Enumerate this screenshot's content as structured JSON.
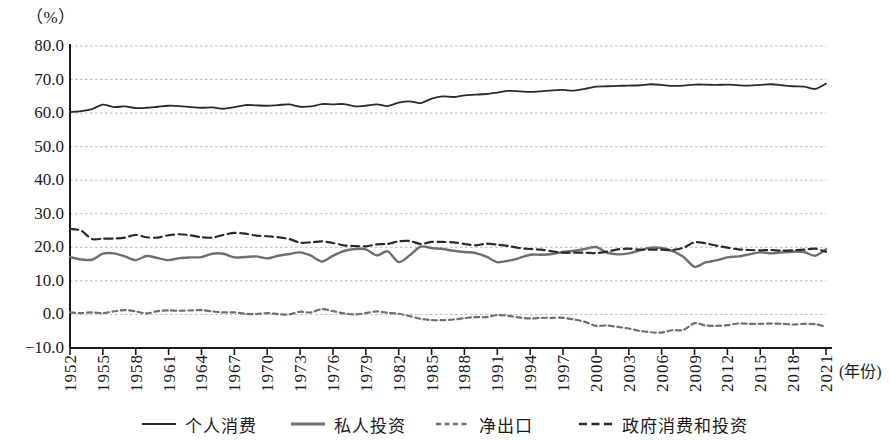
{
  "chart_data": {
    "type": "line",
    "title": "",
    "unit_label": "（%）",
    "xlabel": "(年份)",
    "ylabel": "",
    "ylim": [
      -10,
      80
    ],
    "ytick_labels": [
      "80.0",
      "70.0",
      "60.0",
      "50.0",
      "40.0",
      "30.0",
      "20.0",
      "10.0",
      "0.0",
      "−10.0"
    ],
    "ytick_values": [
      80,
      70,
      60,
      50,
      40,
      30,
      20,
      10,
      0,
      -10
    ],
    "grid": true,
    "grid_style": "dotted-horizontal",
    "legend_position": "bottom",
    "xlim": [
      1952,
      2021
    ],
    "xtick_labels": [
      "1952",
      "1955",
      "1958",
      "1961",
      "1964",
      "1967",
      "1970",
      "1973",
      "1976",
      "1979",
      "1982",
      "1985",
      "1988",
      "1991",
      "1994",
      "1997",
      "2000",
      "2003",
      "2006",
      "2009",
      "2012",
      "2015",
      "2018",
      "2021"
    ],
    "x": [
      1952,
      1953,
      1954,
      1955,
      1956,
      1957,
      1958,
      1959,
      1960,
      1961,
      1962,
      1963,
      1964,
      1965,
      1966,
      1967,
      1968,
      1969,
      1970,
      1971,
      1972,
      1973,
      1974,
      1975,
      1976,
      1977,
      1978,
      1979,
      1980,
      1981,
      1982,
      1983,
      1984,
      1985,
      1986,
      1987,
      1988,
      1989,
      1990,
      1991,
      1992,
      1993,
      1994,
      1995,
      1996,
      1997,
      1998,
      1999,
      2000,
      2001,
      2002,
      2003,
      2004,
      2005,
      2006,
      2007,
      2008,
      2009,
      2010,
      2011,
      2012,
      2013,
      2014,
      2015,
      2016,
      2017,
      2018,
      2019,
      2020,
      2021
    ],
    "series": [
      {
        "name": "个人消费",
        "style": "solid",
        "color": "#2b2b2b",
        "width": 1.8,
        "values": [
          60.3,
          60.6,
          61.2,
          62.5,
          61.8,
          62.0,
          61.5,
          61.6,
          61.9,
          62.2,
          62.1,
          61.8,
          61.6,
          61.7,
          61.3,
          61.8,
          62.4,
          62.3,
          62.2,
          62.4,
          62.6,
          61.9,
          62.0,
          62.7,
          62.6,
          62.7,
          62.0,
          62.2,
          62.6,
          62.1,
          63.1,
          63.5,
          63.0,
          64.3,
          65.0,
          64.8,
          65.3,
          65.5,
          65.7,
          66.1,
          66.6,
          66.5,
          66.3,
          66.5,
          66.8,
          66.9,
          66.7,
          67.2,
          67.9,
          68.0,
          68.1,
          68.2,
          68.3,
          68.6,
          68.4,
          68.1,
          68.2,
          68.5,
          68.5,
          68.4,
          68.5,
          68.3,
          68.2,
          68.4,
          68.6,
          68.3,
          68.0,
          67.9,
          67.2,
          68.8
        ]
      },
      {
        "name": "私人投资",
        "style": "solid",
        "color": "#6f6f6f",
        "width": 2.4,
        "values": [
          17.1,
          16.4,
          16.3,
          18.1,
          18.2,
          17.3,
          16.2,
          17.4,
          16.8,
          16.2,
          16.8,
          17.0,
          17.1,
          18.1,
          18.1,
          17.0,
          17.1,
          17.3,
          16.7,
          17.5,
          18.0,
          18.5,
          17.5,
          15.8,
          17.5,
          18.9,
          19.5,
          19.4,
          17.6,
          18.8,
          15.6,
          17.6,
          20.2,
          19.8,
          19.5,
          19.0,
          18.6,
          18.3,
          17.2,
          15.6,
          16.0,
          16.8,
          17.8,
          17.8,
          18.0,
          18.6,
          19.0,
          19.5,
          20.1,
          18.4,
          17.9,
          18.2,
          19.1,
          19.9,
          19.8,
          18.9,
          17.1,
          14.2,
          15.5,
          16.1,
          17.0,
          17.3,
          17.9,
          18.5,
          18.2,
          18.5,
          18.7,
          18.6,
          17.5,
          19.4
        ]
      },
      {
        "name": "净出口",
        "style": "dashed-short",
        "color": "#6f6f6f",
        "width": 2.2,
        "values": [
          0.6,
          0.4,
          0.6,
          0.4,
          0.9,
          1.3,
          0.9,
          0.3,
          1.0,
          1.2,
          1.1,
          1.2,
          1.3,
          0.9,
          0.6,
          0.6,
          0.2,
          0.1,
          0.4,
          0.1,
          0.0,
          0.8,
          0.6,
          1.6,
          1.0,
          0.3,
          0.0,
          0.4,
          0.9,
          0.5,
          0.2,
          -0.5,
          -1.3,
          -1.7,
          -1.7,
          -1.5,
          -1.1,
          -0.8,
          -0.8,
          -0.2,
          -0.4,
          -0.9,
          -1.2,
          -1.0,
          -1.0,
          -1.0,
          -1.5,
          -2.2,
          -3.4,
          -3.3,
          -3.7,
          -4.2,
          -4.9,
          -5.3,
          -5.4,
          -4.7,
          -4.6,
          -2.6,
          -3.3,
          -3.4,
          -3.2,
          -2.7,
          -2.8,
          -2.8,
          -2.7,
          -2.8,
          -3.0,
          -2.8,
          -2.9,
          -3.7
        ]
      },
      {
        "name": "政府消费和投资",
        "style": "dashed-long",
        "color": "#2b2b2b",
        "width": 2.2,
        "values": [
          25.5,
          25.0,
          22.5,
          22.6,
          22.6,
          22.9,
          23.7,
          23.0,
          22.9,
          23.6,
          23.9,
          23.6,
          23.0,
          22.9,
          23.7,
          24.3,
          24.1,
          23.5,
          23.3,
          23.0,
          22.5,
          21.4,
          21.5,
          21.8,
          21.3,
          20.6,
          20.4,
          20.3,
          20.9,
          21.0,
          21.8,
          21.9,
          21.0,
          21.6,
          21.6,
          21.5,
          21.0,
          20.6,
          21.1,
          20.8,
          20.4,
          19.8,
          19.5,
          19.3,
          18.8,
          18.4,
          18.4,
          18.4,
          18.3,
          18.7,
          19.4,
          19.6,
          19.3,
          19.3,
          19.3,
          19.2,
          19.9,
          21.5,
          21.2,
          20.5,
          19.9,
          19.4,
          19.2,
          19.1,
          19.2,
          19.0,
          19.1,
          19.3,
          19.6,
          18.7
        ]
      }
    ]
  },
  "legend": {
    "items": [
      {
        "label": "个人消费",
        "swatch": "solid-dark"
      },
      {
        "label": "私人投资",
        "swatch": "solid-gray-thick"
      },
      {
        "label": "净出口",
        "swatch": "dashed-short-gray"
      },
      {
        "label": "政府消费和投资",
        "swatch": "dashed-long-dark"
      }
    ]
  }
}
